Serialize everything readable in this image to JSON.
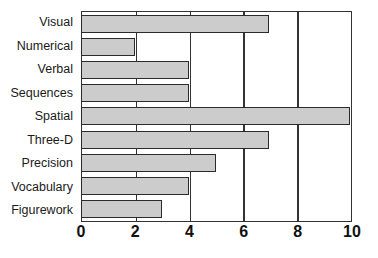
{
  "chart_data": {
    "type": "bar",
    "orientation": "horizontal",
    "title": "",
    "subtitle": "",
    "xlabel": "",
    "ylabel": "",
    "categories": [
      "Visual",
      "Numerical",
      "Verbal",
      "Sequences",
      "Spatial",
      "Three-D",
      "Precision",
      "Vocabulary",
      "Figurework"
    ],
    "values": [
      7,
      2,
      4,
      4,
      10,
      7,
      5,
      4,
      3
    ],
    "xlim": [
      0,
      10
    ],
    "xticks": [
      0,
      2,
      4,
      6,
      8,
      10
    ],
    "xtick_labels": [
      "0",
      "2",
      "4",
      "6",
      "8",
      "10"
    ],
    "grid": "vertical",
    "legend": null,
    "annotations": [],
    "colors": {
      "bar_fill": "#cccccc",
      "bar_border": "#2b2b2b",
      "axis": "#333333",
      "gridline": "#333333",
      "text": "#1a1a1a",
      "background": "#ffffff"
    }
  }
}
